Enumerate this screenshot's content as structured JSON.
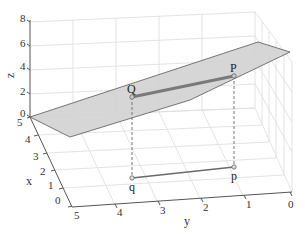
{
  "figure": {
    "type": "3d-plot",
    "axes": {
      "x": {
        "label": "x",
        "ticks": [
          "0",
          "1",
          "2",
          "3",
          "4",
          "5"
        ]
      },
      "y": {
        "label": "y",
        "ticks": [
          "5",
          "4",
          "3",
          "2",
          "1",
          "0"
        ]
      },
      "z": {
        "label": "z",
        "ticks": [
          "0",
          "2",
          "4",
          "6",
          "8"
        ]
      }
    },
    "points": {
      "Q": {
        "label": "Q"
      },
      "P": {
        "label": "P"
      },
      "q": {
        "label": "q"
      },
      "p": {
        "label": "p"
      }
    },
    "colors": {
      "plane_fill": "#d4d4d4",
      "plane_edge": "#6e6e6e",
      "segment_QP": "#7a7a7a",
      "segment_qp": "#6a6a6a",
      "grid": "#dcdcdc",
      "axis": "#555555"
    }
  }
}
